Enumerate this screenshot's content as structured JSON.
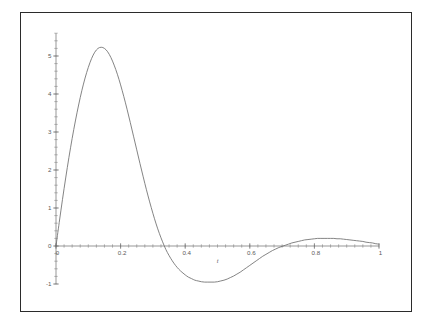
{
  "figure": {
    "frame_color": "#2b2b2b",
    "background": "#ffffff",
    "curve_color": "#6e6e6e",
    "axis_color": "#6b6b6b"
  },
  "chart_data": {
    "type": "line",
    "title": "",
    "subtitle": "",
    "xlabel": "t",
    "ylabel": "",
    "xlim": [
      0,
      1
    ],
    "ylim": [
      -1,
      5.6
    ],
    "grid": false,
    "legend": null,
    "x_ticks": [
      0,
      0.2,
      0.4,
      0.6,
      0.8,
      1
    ],
    "x_tick_labels": [
      "0",
      "0.2",
      "0.4",
      "0.6",
      "0.8",
      "1"
    ],
    "x_minor_tick_step": 0.025,
    "y_ticks": [
      -1,
      0,
      1,
      2,
      3,
      4,
      5
    ],
    "y_tick_labels": [
      "-1",
      "0",
      "1",
      "2",
      "3",
      "4",
      "5"
    ],
    "y_minor_tick_step": 0.2,
    "annotations": [],
    "series": [
      {
        "name": "damped oscillation",
        "x": [
          0,
          0.01,
          0.02,
          0.03,
          0.04,
          0.05,
          0.06,
          0.07,
          0.08,
          0.09,
          0.1,
          0.11,
          0.12,
          0.13,
          0.14,
          0.15,
          0.16,
          0.17,
          0.18,
          0.19,
          0.2,
          0.21,
          0.22,
          0.23,
          0.24,
          0.25,
          0.26,
          0.27,
          0.28,
          0.29,
          0.3,
          0.31,
          0.32,
          0.33,
          0.34,
          0.35,
          0.36,
          0.37,
          0.38,
          0.39,
          0.4,
          0.41,
          0.42,
          0.43,
          0.44,
          0.45,
          0.46,
          0.47,
          0.48,
          0.49,
          0.5,
          0.51,
          0.52,
          0.53,
          0.54,
          0.55,
          0.56,
          0.57,
          0.58,
          0.59,
          0.6,
          0.61,
          0.62,
          0.63,
          0.64,
          0.65,
          0.66,
          0.67,
          0.68,
          0.69,
          0.7,
          0.71,
          0.72,
          0.73,
          0.74,
          0.75,
          0.76,
          0.77,
          0.78,
          0.79,
          0.8,
          0.81,
          0.82,
          0.83,
          0.84,
          0.85,
          0.86,
          0.87,
          0.88,
          0.89,
          0.9,
          0.91,
          0.92,
          0.93,
          0.94,
          0.95,
          0.96,
          0.97,
          0.98,
          0.99,
          1
        ],
        "y": [
          0,
          0.62,
          1.22,
          1.79,
          2.33,
          2.83,
          3.29,
          3.71,
          4.09,
          4.42,
          4.7,
          4.93,
          5.1,
          5.2,
          5.23,
          5.2,
          5.11,
          4.96,
          4.76,
          4.52,
          4.24,
          3.93,
          3.6,
          3.25,
          2.89,
          2.53,
          2.17,
          1.82,
          1.48,
          1.16,
          0.86,
          0.58,
          0.33,
          0.11,
          -0.09,
          -0.25,
          -0.39,
          -0.51,
          -0.61,
          -0.69,
          -0.76,
          -0.82,
          -0.86,
          -0.9,
          -0.92,
          -0.94,
          -0.95,
          -0.95,
          -0.95,
          -0.95,
          -0.94,
          -0.92,
          -0.9,
          -0.87,
          -0.83,
          -0.79,
          -0.74,
          -0.69,
          -0.63,
          -0.57,
          -0.51,
          -0.45,
          -0.39,
          -0.33,
          -0.27,
          -0.22,
          -0.17,
          -0.12,
          -0.08,
          -0.04,
          -0.01,
          0.02,
          0.05,
          0.08,
          0.1,
          0.12,
          0.14,
          0.16,
          0.17,
          0.18,
          0.19,
          0.2,
          0.2,
          0.2,
          0.2,
          0.2,
          0.2,
          0.19,
          0.19,
          0.18,
          0.17,
          0.16,
          0.15,
          0.14,
          0.13,
          0.12,
          0.1,
          0.09,
          0.08,
          0.06,
          0.05
        ]
      }
    ]
  }
}
